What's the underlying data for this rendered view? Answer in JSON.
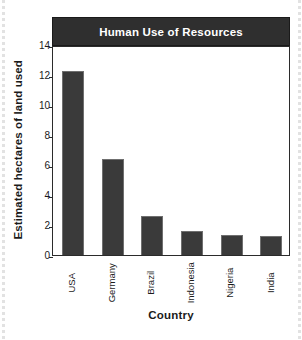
{
  "chart_data": {
    "type": "bar",
    "title": "Human Use of Resources",
    "xlabel": "Country",
    "ylabel": "Estimated hectares of land used",
    "categories": [
      "USA",
      "Germany",
      "Brazil",
      "Indonesia",
      "Nigeria",
      "India"
    ],
    "values": [
      12.3,
      6.4,
      2.6,
      1.6,
      1.35,
      1.25
    ],
    "ylim": [
      0,
      14
    ],
    "yticks": [
      0,
      2,
      4,
      6,
      8,
      10,
      12,
      14
    ],
    "ytick_labels": [
      "0",
      "2",
      "4",
      "6",
      "8",
      "10",
      "12",
      "14"
    ],
    "grid": false,
    "legend": "none",
    "colors": {
      "bar_fill": "#3a3a3a",
      "bar_edge": "#6f6f6f",
      "title_bar_bg": "#2f2f2f",
      "title_text": "#ffffff",
      "axis": "#2b2b2b",
      "plot_bg": "#ffffff",
      "text": "#1b1b1b"
    }
  }
}
